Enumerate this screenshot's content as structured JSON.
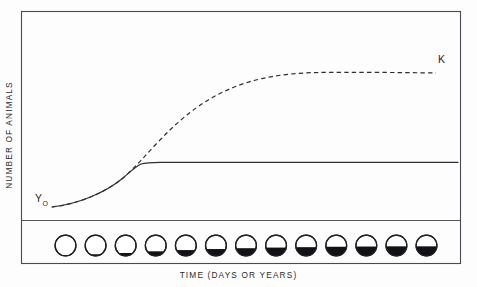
{
  "figure": {
    "axes": {
      "ylabel": "NUMBER  OF  ANIMALS",
      "xlabel": "TIME  (DAYS  OR  YEARS)"
    },
    "labels": {
      "initial_symbol": "Y",
      "initial_subscript": "O",
      "carrying_capacity": "K"
    },
    "colors": {
      "ink": "#2e2e34",
      "frame": "#4a4a52",
      "fill": "#121216",
      "background": "#fdfdfd"
    }
  },
  "chart_data": {
    "type": "line",
    "xlabel": "TIME  (DAYS  OR  YEARS)",
    "ylabel": "NUMBER  OF  ANIMALS",
    "grid": false,
    "legend": "none",
    "xlim": [
      0,
      100
    ],
    "ylim": [
      0,
      100
    ],
    "annotations": [
      {
        "text": "Y",
        "subscript": "O",
        "x": 6,
        "y": 19,
        "series": "early-growth-start"
      },
      {
        "text": "K",
        "x": 95,
        "y": 91,
        "series": "carrying-capacity-plateau"
      }
    ],
    "series": [
      {
        "name": "Unlimited (logistic) growth to K",
        "style": "dashed",
        "x": [
          5,
          12,
          19,
          26,
          30,
          35,
          40,
          45,
          50,
          55,
          60,
          65,
          70,
          75,
          80,
          85,
          90,
          95,
          100
        ],
        "y": [
          6,
          8,
          13,
          22,
          28,
          36,
          45,
          53,
          61,
          69,
          76,
          81,
          85,
          88,
          90,
          91,
          91,
          91,
          91
        ]
      },
      {
        "name": "Limited growth (levels off early)",
        "style": "solid",
        "x": [
          5,
          12,
          19,
          26,
          30,
          33,
          35,
          40,
          50,
          60,
          70,
          80,
          90,
          100
        ],
        "y": [
          6,
          8,
          13,
          22,
          27,
          30,
          31,
          31,
          31,
          31,
          31,
          31,
          31,
          31
        ]
      }
    ],
    "jars": {
      "description": "Row of 13 jars below the plot, each showing a rising black level that tracks the limited-growth curve",
      "count": 13,
      "fill_fractions": [
        0.04,
        0.08,
        0.14,
        0.22,
        0.28,
        0.33,
        0.37,
        0.4,
        0.42,
        0.44,
        0.45,
        0.46,
        0.46
      ]
    }
  }
}
